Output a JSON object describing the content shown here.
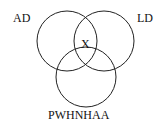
{
  "diagram": {
    "type": "venn",
    "sets": [
      {
        "label": "AD",
        "position": "top-left"
      },
      {
        "label": "LD",
        "position": "top-right"
      },
      {
        "label": "PWHNHAA",
        "position": "bottom"
      }
    ],
    "intersection_label": "X",
    "colors": {
      "stroke": "#222222",
      "text": "#111111",
      "background": "#ffffff"
    }
  }
}
